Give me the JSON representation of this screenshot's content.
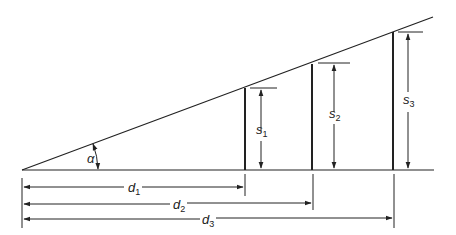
{
  "diagram": {
    "angle_label": "α",
    "verticals": [
      {
        "label": "s",
        "sub": "1"
      },
      {
        "label": "s",
        "sub": "2"
      },
      {
        "label": "s",
        "sub": "3"
      }
    ],
    "distances": [
      {
        "label": "d",
        "sub": "1"
      },
      {
        "label": "d",
        "sub": "2"
      },
      {
        "label": "d",
        "sub": "3"
      }
    ]
  },
  "colors": {
    "line": "#222222",
    "background": "#ffffff"
  }
}
